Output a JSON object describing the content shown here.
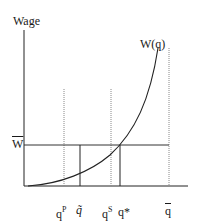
{
  "diagram": {
    "y_axis_label": "Wage",
    "curve_label": "W(q)",
    "wage_level_label": "W",
    "x_labels": {
      "q_p": {
        "base": "q",
        "sup": "P"
      },
      "q_tilde": "q̃",
      "q_s": {
        "base": "q",
        "sup": "S"
      },
      "q_star": "q*",
      "q_bar": "q"
    },
    "colors": {
      "line": "#1a1a1a",
      "dotted": "#888888"
    }
  }
}
